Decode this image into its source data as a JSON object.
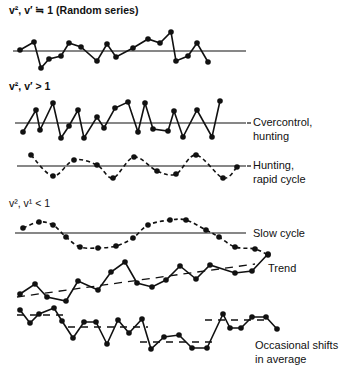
{
  "headings": {
    "random": "v², v′ ≒ 1 (Random series)",
    "greater": "v², v′ > 1",
    "less": "v², v¹ < 1"
  },
  "labels": {
    "overcontrol_1": "Cvercontrol,",
    "overcontrol_2": "hunting",
    "hunting_1": "Hunting,",
    "hunting_2": "rapid cycle",
    "slow": "Slow cycle",
    "trend": "Trend",
    "shifts_1": "Occasional shifts",
    "shifts_2": "in average"
  },
  "colors": {
    "ink": "#111111",
    "background": "#ffffff"
  },
  "chart_data": {
    "type": "line",
    "panels": [
      {
        "name": "Random series",
        "group": "v², v′ ≒ 1",
        "baseline_y": 51,
        "baseline_x": [
          13,
          246
        ],
        "connector": "solid",
        "points": [
          [
            20,
            50
          ],
          [
            34,
            42
          ],
          [
            41,
            68
          ],
          [
            49,
            59
          ],
          [
            61,
            56
          ],
          [
            69,
            43
          ],
          [
            81,
            47
          ],
          [
            97,
            61
          ],
          [
            107,
            44
          ],
          [
            116,
            57
          ],
          [
            133,
            48
          ],
          [
            148,
            39
          ],
          [
            160,
            43
          ],
          [
            171,
            32
          ],
          [
            176,
            61
          ],
          [
            188,
            56
          ],
          [
            197,
            43
          ],
          [
            208,
            62
          ]
        ]
      },
      {
        "name": "Overcontrol, hunting",
        "group": "v², v′ > 1",
        "baseline_y": 123,
        "baseline_x": [
          15,
          246
        ],
        "connector": "solid",
        "points": [
          [
            23,
            132
          ],
          [
            36,
            110
          ],
          [
            40,
            130
          ],
          [
            53,
            103
          ],
          [
            61,
            138
          ],
          [
            69,
            126
          ],
          [
            78,
            110
          ],
          [
            84,
            138
          ],
          [
            97,
            117
          ],
          [
            104,
            128
          ],
          [
            115,
            108
          ],
          [
            128,
            102
          ],
          [
            138,
            132
          ],
          [
            145,
            103
          ],
          [
            153,
            129
          ],
          [
            168,
            131
          ],
          [
            174,
            111
          ],
          [
            183,
            137
          ],
          [
            197,
            110
          ],
          [
            212,
            137
          ],
          [
            220,
            101
          ]
        ]
      },
      {
        "name": "Hunting, rapid cycle",
        "group": "v², v′ > 1",
        "baseline_y": 166,
        "baseline_x": [
          17,
          246
        ],
        "connector": "dashed-wave",
        "points": [
          [
            31,
            155
          ],
          [
            53,
            176
          ],
          [
            74,
            160
          ],
          [
            97,
            165
          ],
          [
            113,
            178
          ],
          [
            134,
            157
          ],
          [
            157,
            171
          ],
          [
            176,
            174
          ],
          [
            196,
            155
          ],
          [
            223,
            178
          ],
          [
            237,
            167
          ]
        ]
      },
      {
        "name": "Slow cycle",
        "group": "v², v¹ < 1",
        "baseline_y": 233,
        "baseline_x": [
          15,
          246
        ],
        "connector": "dashed-wave",
        "points": [
          [
            23,
            228
          ],
          [
            39,
            222
          ],
          [
            53,
            225
          ],
          [
            66,
            237
          ],
          [
            80,
            247
          ],
          [
            98,
            248
          ],
          [
            116,
            246
          ],
          [
            133,
            238
          ],
          [
            148,
            225
          ],
          [
            170,
            220
          ],
          [
            186,
            220
          ],
          [
            206,
            230
          ],
          [
            219,
            237
          ],
          [
            235,
            247
          ],
          [
            255,
            249
          ],
          [
            268,
            255
          ]
        ]
      },
      {
        "name": "Trend",
        "group": "v², v¹ < 1",
        "connector": "solid",
        "trend_line": [
          [
            17,
            297
          ],
          [
            255,
            264
          ]
        ],
        "points": [
          [
            20,
            294
          ],
          [
            35,
            284
          ],
          [
            47,
            297
          ],
          [
            66,
            301
          ],
          [
            78,
            281
          ],
          [
            98,
            290
          ],
          [
            111,
            272
          ],
          [
            125,
            262
          ],
          [
            137,
            283
          ],
          [
            152,
            287
          ],
          [
            166,
            280
          ],
          [
            180,
            266
          ],
          [
            196,
            279
          ],
          [
            210,
            265
          ],
          [
            235,
            273
          ],
          [
            252,
            271
          ],
          [
            268,
            254
          ]
        ]
      },
      {
        "name": "Occasional shifts in average",
        "group": "v², v¹ < 1",
        "connector": "solid",
        "average_segments": [
          [
            17,
            68,
            315
          ],
          [
            68,
            148,
            327
          ],
          [
            140,
            212,
            342
          ],
          [
            205,
            265,
            320
          ]
        ],
        "points": [
          [
            20,
            310
          ],
          [
            30,
            323
          ],
          [
            39,
            314
          ],
          [
            54,
            308
          ],
          [
            62,
            321
          ],
          [
            73,
            338
          ],
          [
            84,
            322
          ],
          [
            96,
            322
          ],
          [
            107,
            344
          ],
          [
            118,
            320
          ],
          [
            129,
            333
          ],
          [
            142,
            319
          ],
          [
            151,
            349
          ],
          [
            164,
            337
          ],
          [
            179,
            335
          ],
          [
            192,
            348
          ],
          [
            207,
            348
          ],
          [
            223,
            314
          ],
          [
            230,
            328
          ],
          [
            241,
            328
          ],
          [
            252,
            317
          ],
          [
            266,
            317
          ],
          [
            277,
            329
          ]
        ]
      }
    ]
  }
}
